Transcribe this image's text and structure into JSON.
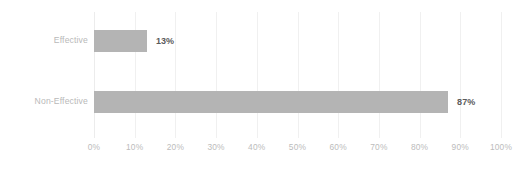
{
  "chart_data": {
    "type": "bar",
    "orientation": "horizontal",
    "title": "",
    "subtitle": "",
    "xlabel": "",
    "ylabel": "",
    "categories": [
      "Effective",
      "Non-Effective"
    ],
    "values": [
      13,
      87
    ],
    "value_labels": [
      "13%",
      "87%"
    ],
    "xlim": [
      0,
      100
    ],
    "x_ticks": [
      0,
      10,
      20,
      30,
      40,
      50,
      60,
      70,
      80,
      90,
      100
    ],
    "x_tick_labels": [
      "0%",
      "10%",
      "20%",
      "30%",
      "40%",
      "50%",
      "60%",
      "70%",
      "80%",
      "90%",
      "100%"
    ],
    "grid": true,
    "grid_axis": "x",
    "legend": false,
    "legend_position": "none",
    "series": [
      {
        "name": "",
        "values": [
          13,
          87
        ]
      }
    ],
    "colors": {
      "bar_fill": "#b4b4b4",
      "gridline": "#f0f0f0",
      "data_label": "#5b5b5b",
      "category_label": "#b9b9b9",
      "tick_label": "#bcbcbc",
      "background": "#ffffff"
    }
  }
}
